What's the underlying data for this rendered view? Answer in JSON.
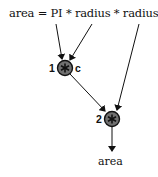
{
  "diagram": {
    "expression": "area = PI * radius * radius",
    "output_label": "area",
    "nodes": [
      {
        "id": "1",
        "op": "*",
        "label": "1",
        "tag": "c"
      },
      {
        "id": "2",
        "op": "*",
        "label": "2",
        "tag": ""
      }
    ],
    "edges": [
      {
        "from": "PI",
        "to": "1"
      },
      {
        "from": "radius",
        "to": "1"
      },
      {
        "from": "1",
        "to": "2"
      },
      {
        "from": "radius",
        "to": "2"
      },
      {
        "from": "2",
        "to": "area"
      }
    ],
    "colors": {
      "node_fill": "#707070",
      "node_stroke": "#111111",
      "line": "#111111"
    }
  }
}
